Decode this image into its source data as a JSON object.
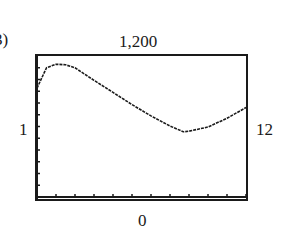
{
  "figure": {
    "part_label": "3)",
    "window": {
      "xmin_label": "1",
      "xmax_label": "12",
      "ymin_label": "0",
      "ymax_label": "1,200"
    }
  },
  "chart_data": {
    "type": "line",
    "title": "",
    "xlabel": "",
    "ylabel": "",
    "xlim": [
      1,
      12
    ],
    "ylim": [
      0,
      1200
    ],
    "grid": false,
    "legend": null,
    "x_ticks_count": 11,
    "y_ticks_count": 12,
    "series": [
      {
        "name": "curve",
        "x": [
          1,
          1.5,
          2,
          2.5,
          3,
          4,
          5,
          6,
          7,
          8,
          8.7,
          9,
          10,
          11,
          12
        ],
        "y": [
          927,
          1100,
          1130,
          1125,
          1100,
          993,
          890,
          786,
          690,
          604,
          555,
          560,
          596,
          670,
          762
        ]
      }
    ],
    "annotations": [
      "1,200",
      "1",
      "12",
      "0"
    ]
  }
}
